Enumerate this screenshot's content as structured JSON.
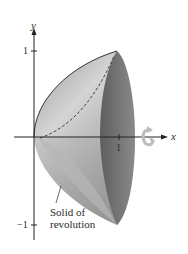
{
  "figure": {
    "type": "solid-of-revolution-diagram",
    "axes": {
      "x_label": "x",
      "y_label": "y",
      "x_ticks": [
        {
          "value": 1,
          "label": "1"
        }
      ],
      "y_ticks": [
        {
          "value": 1,
          "label": "1"
        },
        {
          "value": -1,
          "label": "−1"
        }
      ]
    },
    "annotation": {
      "line1": "Solid of",
      "line2": "revolution"
    },
    "rotation_icon": "rotation-arrow-icon",
    "colors": {
      "surface_light": "#c9c9c9",
      "surface_mid": "#a9a9a9",
      "surface_dark": "#7a7a7a",
      "cap": "#6e6e6e",
      "axis": "#222222",
      "rotation_arrow": "#bdbdbd"
    }
  }
}
